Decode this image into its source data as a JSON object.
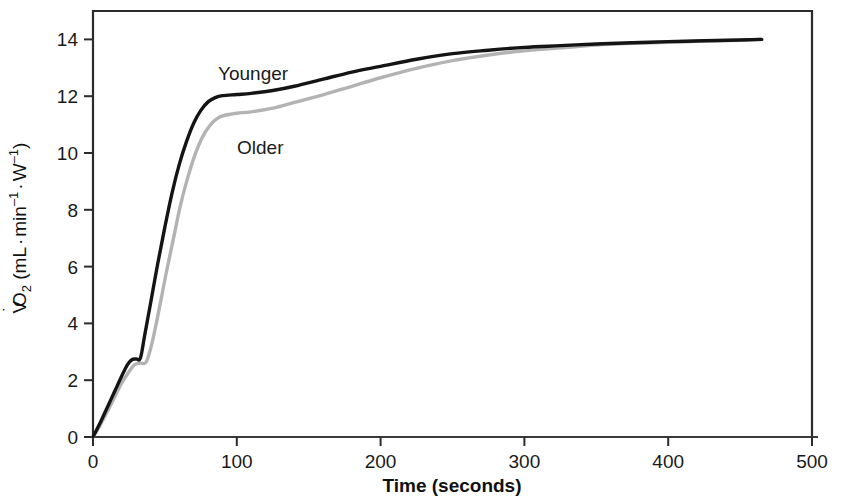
{
  "chart_data": {
    "type": "line",
    "title": "",
    "subtitle": "",
    "xlabel": "Time (seconds)",
    "ylabel": "V̇O2 (mL·min⁻¹·W⁻¹)",
    "ylabel_parts": {
      "v": "V",
      "dot": "˙",
      "o": "O",
      "sub2": "2",
      "open": " (mL",
      "middot1": "·",
      "min": "min",
      "sup_minus1_a": "–1",
      "middot2": "·",
      "w": "W",
      "sup_minus1_b": "–1",
      "close": ")"
    },
    "xlim": [
      0,
      500
    ],
    "ylim": [
      0,
      15
    ],
    "xticks": [
      0,
      100,
      200,
      300,
      400,
      500
    ],
    "xtick_labels": [
      "0",
      "100",
      "200",
      "300",
      "400",
      "500"
    ],
    "yticks": [
      0,
      2,
      4,
      6,
      8,
      10,
      12,
      14
    ],
    "ytick_labels": [
      "0",
      "2",
      "4",
      "6",
      "8",
      "10",
      "12",
      "14"
    ],
    "grid": false,
    "legend_position": "inline-annotations",
    "annotations": [
      {
        "name": "younger-label",
        "text": "Younger",
        "x_px": 218,
        "y_px": 80
      },
      {
        "name": "older-label",
        "text": "Older",
        "x_px": 237,
        "y_px": 154
      }
    ],
    "series": [
      {
        "name": "Younger",
        "color": "#141414",
        "width": 3.4,
        "points": [
          [
            0,
            0.0
          ],
          [
            5,
            0.5
          ],
          [
            10,
            1.05
          ],
          [
            15,
            1.6
          ],
          [
            20,
            2.15
          ],
          [
            24,
            2.55
          ],
          [
            27,
            2.72
          ],
          [
            30,
            2.75
          ],
          [
            33,
            2.78
          ],
          [
            36,
            3.6
          ],
          [
            40,
            4.7
          ],
          [
            45,
            6.1
          ],
          [
            50,
            7.4
          ],
          [
            55,
            8.6
          ],
          [
            60,
            9.6
          ],
          [
            65,
            10.4
          ],
          [
            70,
            11.05
          ],
          [
            75,
            11.5
          ],
          [
            80,
            11.8
          ],
          [
            85,
            11.95
          ],
          [
            90,
            12.02
          ],
          [
            100,
            12.06
          ],
          [
            110,
            12.1
          ],
          [
            125,
            12.2
          ],
          [
            140,
            12.35
          ],
          [
            160,
            12.6
          ],
          [
            180,
            12.85
          ],
          [
            200,
            13.05
          ],
          [
            225,
            13.3
          ],
          [
            250,
            13.5
          ],
          [
            275,
            13.62
          ],
          [
            300,
            13.72
          ],
          [
            325,
            13.78
          ],
          [
            350,
            13.84
          ],
          [
            375,
            13.88
          ],
          [
            400,
            13.92
          ],
          [
            425,
            13.95
          ],
          [
            450,
            13.98
          ],
          [
            465,
            14.0
          ]
        ]
      },
      {
        "name": "Older",
        "color": "#b3b3b3",
        "width": 3.4,
        "points": [
          [
            0,
            0.0
          ],
          [
            5,
            0.42
          ],
          [
            10,
            0.9
          ],
          [
            15,
            1.4
          ],
          [
            20,
            1.9
          ],
          [
            25,
            2.3
          ],
          [
            29,
            2.55
          ],
          [
            33,
            2.6
          ],
          [
            37,
            2.64
          ],
          [
            41,
            3.3
          ],
          [
            46,
            4.5
          ],
          [
            51,
            5.8
          ],
          [
            56,
            7.0
          ],
          [
            61,
            8.2
          ],
          [
            66,
            9.15
          ],
          [
            71,
            9.95
          ],
          [
            76,
            10.55
          ],
          [
            81,
            10.95
          ],
          [
            86,
            11.2
          ],
          [
            91,
            11.32
          ],
          [
            100,
            11.4
          ],
          [
            110,
            11.45
          ],
          [
            125,
            11.58
          ],
          [
            140,
            11.78
          ],
          [
            160,
            12.05
          ],
          [
            180,
            12.35
          ],
          [
            200,
            12.65
          ],
          [
            225,
            12.98
          ],
          [
            250,
            13.25
          ],
          [
            275,
            13.45
          ],
          [
            300,
            13.6
          ],
          [
            325,
            13.7
          ],
          [
            350,
            13.8
          ],
          [
            375,
            13.86
          ],
          [
            400,
            13.9
          ],
          [
            425,
            13.94
          ],
          [
            450,
            13.97
          ],
          [
            465,
            14.0
          ]
        ]
      }
    ]
  },
  "plot_frame": {
    "left_px": 93,
    "right_px": 812,
    "top_px": 11,
    "bottom_px": 437,
    "axis_color": "#2b2b2b"
  }
}
